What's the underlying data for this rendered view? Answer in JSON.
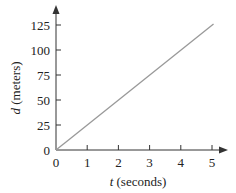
{
  "chart_data": {
    "type": "line",
    "title": "",
    "xlabel": {
      "var": "t",
      "unit": " (seconds)"
    },
    "ylabel": {
      "var": "d",
      "unit": " (meters)"
    },
    "x_ticks": [
      "0",
      "1",
      "2",
      "3",
      "4",
      "5"
    ],
    "y_ticks": [
      "0",
      "25",
      "50",
      "75",
      "100",
      "125"
    ],
    "xlim": [
      0,
      5.3
    ],
    "ylim": [
      0,
      130
    ],
    "grid": false,
    "series": [
      {
        "name": "d = 25t",
        "x": [
          0,
          5.05
        ],
        "y": [
          0,
          126
        ],
        "color": "#999999"
      }
    ]
  }
}
